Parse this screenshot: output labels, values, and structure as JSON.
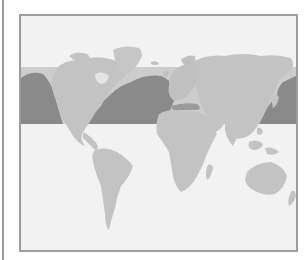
{
  "map": {
    "title": "",
    "projection": "world-equirectangular",
    "highlight_band": {
      "description": "horizontal latitude band",
      "approx_latitudes": "25N-60N"
    },
    "colors": {
      "background": "#f2f2f2",
      "land": "#c3c3c3",
      "band_land": "#bdbdbd",
      "band_ocean": "#8a8a8a",
      "band_fill": "#cdcdcd",
      "frame_border": "#9d9d9d",
      "left_rule": "#9a9a9a"
    },
    "regions": [
      {
        "name": "north-america"
      },
      {
        "name": "greenland"
      },
      {
        "name": "south-america"
      },
      {
        "name": "europe"
      },
      {
        "name": "africa"
      },
      {
        "name": "asia"
      },
      {
        "name": "australia"
      },
      {
        "name": "pacific-ocean-west-band"
      },
      {
        "name": "atlantic-ocean-band"
      },
      {
        "name": "pacific-ocean-east-band"
      }
    ]
  }
}
